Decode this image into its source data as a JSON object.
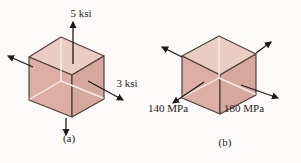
{
  "figure": {
    "background": "#fbfaf8",
    "colors": {
      "face_top": "#eaccc3",
      "face_left": "#dcaea5",
      "face_right": "#d5a89d",
      "edge": "#4d403b",
      "hidden_edge": "#f7eeea",
      "arrow": "#1d1b1a",
      "label_text": "#292220"
    },
    "cube_a": {
      "label": "(a)",
      "vertical_stress": "5 ksi",
      "horizontal_stress": "3 ksi"
    },
    "cube_b": {
      "label": "(b)",
      "left_stress": "140 MPa",
      "right_stress": "180 MPa"
    }
  }
}
